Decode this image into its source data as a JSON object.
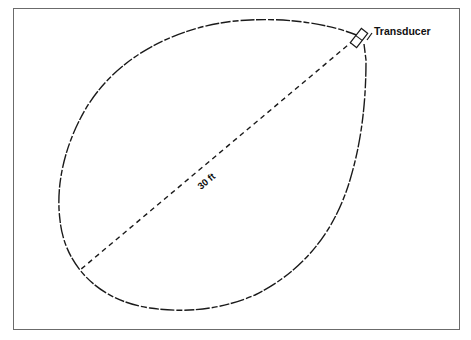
{
  "diagram": {
    "labels": {
      "transducer": "Transducer",
      "distance": "30 ft"
    },
    "colors": {
      "line": "#1a1a1a",
      "frame": "#6b6b6b",
      "background": "#ffffff"
    }
  },
  "caption": {
    "text": ""
  }
}
